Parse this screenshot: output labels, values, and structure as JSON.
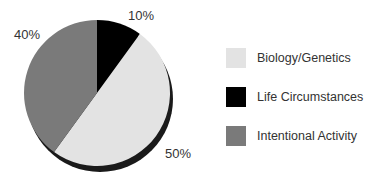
{
  "chart_data": {
    "type": "pie",
    "title": "",
    "categories": [
      "Biology/Genetics",
      "Life Circumstances",
      "Intentional Activity"
    ],
    "values": [
      50,
      10,
      40
    ],
    "labels": [
      "50%",
      "10%",
      "40%"
    ],
    "colors": [
      "#e3e3e3",
      "#000000",
      "#7a7a7a"
    ],
    "legend_position": "right",
    "style": "3d-pie"
  },
  "labels": {
    "biology_pct": "50%",
    "life_pct": "10%",
    "intentional_pct": "40%"
  },
  "legend": {
    "items": [
      {
        "label": "Biology/Genetics",
        "color": "#e3e3e3"
      },
      {
        "label": "Life Circumstances",
        "color": "#000000"
      },
      {
        "label": "Intentional Activity",
        "color": "#7a7a7a"
      }
    ]
  }
}
